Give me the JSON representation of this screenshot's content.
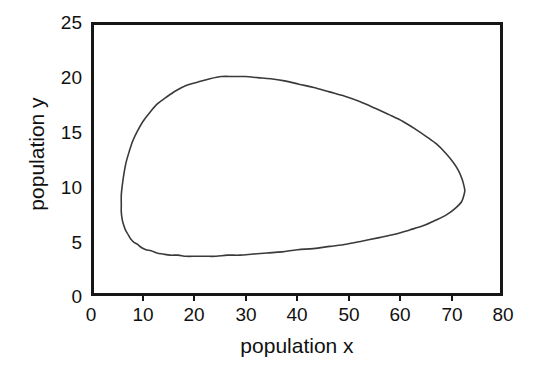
{
  "chart_data": {
    "type": "line",
    "title": "",
    "subtitle": "",
    "xlabel": "population x",
    "ylabel": "population y",
    "xlim": [
      0,
      80
    ],
    "ylim": [
      0,
      25
    ],
    "xticks": [
      0,
      10,
      20,
      30,
      40,
      50,
      60,
      70,
      80
    ],
    "yticks": [
      0,
      5,
      10,
      15,
      20,
      25
    ],
    "xticklabels": [
      "0",
      "10",
      "20",
      "30",
      "40",
      "50",
      "60",
      "70",
      "80"
    ],
    "yticklabels": [
      "0",
      "5",
      "10",
      "15",
      "20",
      "25"
    ],
    "grid": false,
    "legend": null,
    "annotations": [],
    "series": [
      {
        "name": "predator-prey orbit",
        "closed": true,
        "color": "#3a3a3a",
        "linewidth": 1.6,
        "x": [
          71.9,
          71.4,
          70.2,
          68.5,
          66.4,
          64.0,
          61.3,
          58.4,
          55.4,
          52.2,
          49.0,
          45.8,
          42.6,
          39.5,
          36.5,
          33.6,
          30.9,
          28.3,
          25.9,
          23.7,
          21.6,
          19.7,
          17.9,
          16.3,
          14.8,
          13.4,
          12.2,
          11.1,
          10.1,
          9.2,
          8.4,
          7.7,
          7.1,
          6.6,
          6.1,
          5.8,
          5.5,
          5.3,
          5.3,
          5.3,
          5.5,
          5.8,
          6.2,
          6.8,
          7.5,
          8.4,
          9.5,
          10.8,
          12.3,
          14.0,
          15.9,
          18.0,
          20.2,
          22.5,
          24.8,
          27.1,
          29.4,
          31.8,
          34.3,
          37.0,
          39.8,
          42.7,
          45.7,
          48.7,
          51.7,
          54.6,
          57.4,
          60.0,
          62.4,
          64.6,
          66.6,
          68.3,
          69.7,
          70.8,
          71.5,
          71.9,
          72.0,
          71.9
        ],
        "y": [
          9.6,
          8.9,
          8.3,
          7.7,
          7.2,
          6.7,
          6.3,
          5.9,
          5.6,
          5.3,
          5.0,
          4.8,
          4.6,
          4.5,
          4.3,
          4.2,
          4.1,
          4.0,
          4.0,
          3.9,
          3.9,
          3.9,
          3.9,
          4.0,
          4.0,
          4.1,
          4.2,
          4.4,
          4.5,
          4.7,
          5.0,
          5.2,
          5.5,
          5.9,
          6.3,
          6.7,
          7.2,
          7.9,
          8.6,
          9.5,
          10.4,
          11.4,
          12.4,
          13.4,
          14.4,
          15.3,
          16.2,
          17.0,
          17.8,
          18.4,
          19.0,
          19.5,
          19.8,
          20.1,
          20.3,
          20.3,
          20.3,
          20.2,
          20.1,
          19.9,
          19.6,
          19.3,
          18.9,
          18.5,
          18.0,
          17.4,
          16.8,
          16.2,
          15.5,
          14.8,
          14.1,
          13.3,
          12.5,
          11.7,
          10.9,
          10.2,
          9.9,
          9.6
        ],
        "extremes": {
          "x_min": 5.3,
          "x_max": 72.0,
          "y_min": 3.9,
          "y_max": 20.3,
          "x_at_y_max": 25.0,
          "y_at_x_max": 10.0,
          "x_at_y_min": 22.0,
          "y_at_x_min": 9.0
        }
      }
    ]
  },
  "axes": {
    "x_tick_labels": [
      "0",
      "10",
      "20",
      "30",
      "40",
      "50",
      "60",
      "70",
      "80"
    ],
    "y_tick_labels": [
      "0",
      "5",
      "10",
      "15",
      "20",
      "25"
    ],
    "x_axis_title": "population x",
    "y_axis_title": "population y"
  },
  "style": {
    "frame_color": "#161616",
    "curve_color": "#3a3a3a",
    "text_color": "#111111",
    "background": "#ffffff"
  }
}
